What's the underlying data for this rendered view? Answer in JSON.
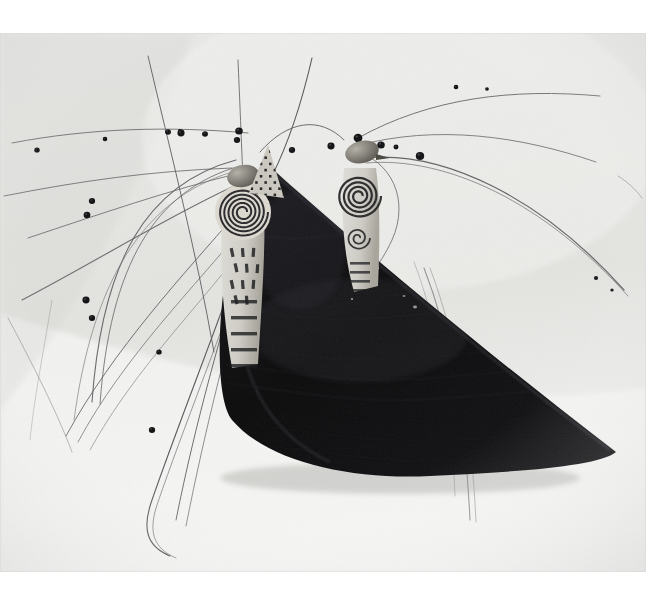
{
  "document": {
    "kind": "photograph",
    "medium": "black-and-white gelatin silver photograph",
    "subject": "ritual sculpture: dark triangular shell-like form topped by two spiral-decorated figures with radiating beaded antennae rods",
    "orientation": "landscape"
  },
  "canvas": {
    "width": 667,
    "height": 594,
    "page_background": "#ffffff"
  },
  "photo": {
    "x": 0,
    "y": 33,
    "width": 646,
    "height": 539,
    "background_top": "#e9e9e7",
    "background_bottom": "#f4f4f3",
    "vignette_opacity": 0.1,
    "grain_opacity": 0.06,
    "edge_shadow": "#d8d8d6"
  },
  "palette": {
    "paper_white": "#ffffff",
    "backdrop_light": "#eeeeec",
    "backdrop_mid": "#e3e3e0",
    "backdrop_shadow": "#d4d4d1",
    "form_black": "#0b0b0c",
    "form_black_mid": "#17171a",
    "form_highlight": "#3a3a3e",
    "rod_grey": "#6b6b6e",
    "rod_dark": "#3c3c40",
    "bead_black": "#111113",
    "figure_light": "#cfcdc6",
    "figure_mid": "#a8a59c",
    "spiral_dark": "#1a1a1c",
    "speck_light": "#dcdcd8"
  },
  "subject": {
    "dark_form": {
      "name": "triangular-shell-body",
      "description": "large dark triangular wedge, matte black with horizontal striations and small light specks",
      "apex": [
        268,
        165
      ],
      "right_tip": [
        616,
        452
      ],
      "left_base": [
        224,
        392
      ],
      "bottom_curve": [
        330,
        468
      ],
      "striation_count": 14,
      "speck_count": 22
    },
    "figures": [
      {
        "name": "left-spiral-figure",
        "center": [
          243,
          210
        ],
        "head_center": [
          243,
          176
        ],
        "spiral_center": [
          243,
          212
        ],
        "spiral_rings": 5,
        "spiral_outer_radius": 25,
        "has_conical_cap": true,
        "cap_pattern": "checkered diamond lattice",
        "cap_apex": [
          268,
          145
        ],
        "body_marks": "dark dashes and banded stripes on a light tapering body"
      },
      {
        "name": "right-spiral-figure",
        "center": [
          360,
          185
        ],
        "head_center": [
          362,
          152
        ],
        "spiral_center": [
          359,
          196
        ],
        "spiral_rings": 4,
        "spiral_outer_radius": 22,
        "has_conical_cap": false,
        "cap_pattern": "none",
        "body_marks": "spiral scrollwork over a light body"
      }
    ],
    "rods": {
      "name": "antenna-rods",
      "count": 26,
      "description": "long slender curved rods radiating left and right, several threaded with dark round beads",
      "bead_count": 24,
      "stroke_color": "#5f5f62",
      "stroke_width_range": [
        0.6,
        1.6
      ]
    }
  },
  "labels": {
    "alt_text": "Black-and-white photograph of a sculptural object with a dark triangular body and long beaded antennae."
  }
}
